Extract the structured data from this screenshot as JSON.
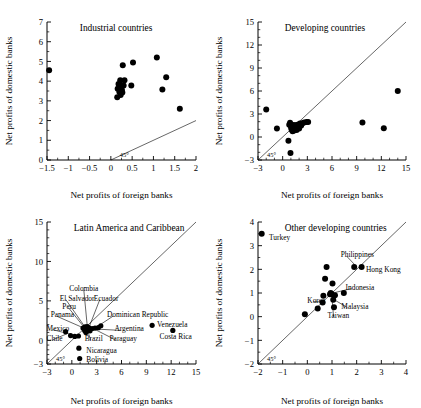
{
  "figure": {
    "name": "net-profits-domestic-vs-foreign-banks",
    "panel_count": 4
  },
  "chart_data": [
    {
      "id": "industrial-countries",
      "type": "scatter",
      "title": "Industrial countries",
      "xlabel": "Net profits of foreign banks",
      "ylabel": "Net profits of domestic banks",
      "xlim": [
        -1.5,
        2
      ],
      "ylim": [
        0,
        7
      ],
      "xticks": [
        -1.5,
        -1,
        -0.5,
        0,
        0.5,
        1,
        1.5,
        2
      ],
      "xticklabels": [
        "−1.5",
        "−1",
        "−0.5",
        "0",
        "0.5",
        "1",
        "1.5",
        "2"
      ],
      "yticks": [
        0,
        1,
        2,
        3,
        4,
        5,
        6,
        7
      ],
      "yticklabels": [
        "0",
        "1",
        "2",
        "3",
        "4",
        "5",
        "6",
        "7"
      ],
      "grid": false,
      "reference_line": {
        "label": "45°",
        "type": "identity"
      },
      "points": [
        [
          -1.45,
          4.55
        ],
        [
          0.28,
          4.8
        ],
        [
          0.52,
          4.95
        ],
        [
          0.22,
          4.05
        ],
        [
          0.32,
          4.05
        ],
        [
          0.18,
          3.85
        ],
        [
          0.24,
          3.8
        ],
        [
          0.3,
          3.78
        ],
        [
          0.48,
          3.78
        ],
        [
          0.16,
          3.62
        ],
        [
          0.21,
          3.6
        ],
        [
          0.26,
          3.55
        ],
        [
          0.2,
          3.45
        ],
        [
          0.27,
          3.42
        ],
        [
          0.23,
          3.3
        ],
        [
          0.15,
          3.18
        ],
        [
          1.08,
          5.2
        ],
        [
          1.3,
          4.2
        ],
        [
          1.21,
          3.58
        ],
        [
          1.62,
          2.6
        ]
      ]
    },
    {
      "id": "developing-countries",
      "type": "scatter",
      "title": "Developing countries",
      "xlabel": "Net profits of foreign banks",
      "ylabel": "Net profits of domestic banks",
      "xlim": [
        -3,
        15
      ],
      "ylim": [
        -3,
        15
      ],
      "xticks": [
        -3,
        0,
        3,
        6,
        9,
        12,
        15
      ],
      "xticklabels": [
        "−3",
        "0",
        "3",
        "6",
        "9",
        "12",
        "15"
      ],
      "yticks": [
        -3,
        0,
        3,
        6,
        9,
        12,
        15
      ],
      "yticklabels": [
        "−3",
        "0",
        "3",
        "6",
        "9",
        "12",
        "15"
      ],
      "grid": false,
      "reference_line": {
        "label": "45°",
        "type": "identity"
      },
      "points": [
        [
          -2.0,
          3.6
        ],
        [
          -0.7,
          1.1
        ],
        [
          0.7,
          -0.5
        ],
        [
          0.95,
          -2.1
        ],
        [
          0.8,
          1.6
        ],
        [
          0.9,
          1.85
        ],
        [
          1.0,
          1.45
        ],
        [
          1.05,
          1.15
        ],
        [
          1.1,
          0.95
        ],
        [
          1.15,
          1.35
        ],
        [
          1.2,
          0.75
        ],
        [
          1.25,
          1.25
        ],
        [
          1.3,
          1.05
        ],
        [
          1.35,
          1.55
        ],
        [
          1.4,
          0.85
        ],
        [
          1.45,
          1.3
        ],
        [
          1.5,
          1.0
        ],
        [
          1.55,
          1.5
        ],
        [
          1.6,
          1.2
        ],
        [
          1.7,
          0.9
        ],
        [
          1.8,
          1.6
        ],
        [
          1.9,
          1.35
        ],
        [
          2.0,
          1.1
        ],
        [
          2.1,
          1.75
        ],
        [
          2.25,
          1.5
        ],
        [
          2.4,
          1.8
        ],
        [
          2.6,
          1.9
        ],
        [
          2.9,
          1.95
        ],
        [
          3.1,
          1.95
        ],
        [
          9.7,
          1.9
        ],
        [
          12.3,
          1.15
        ],
        [
          14.0,
          6.0
        ]
      ]
    },
    {
      "id": "latin-america-and-caribbean",
      "type": "scatter",
      "title": "Latin America and Caribbean",
      "xlabel": "Net profits  of foreign banks",
      "ylabel": "Net profits of domestic banks",
      "xlim": [
        -3,
        15
      ],
      "ylim": [
        -3,
        15
      ],
      "xticks": [
        -3,
        0,
        3,
        6,
        9,
        12,
        15
      ],
      "xticklabels": [
        "−3",
        "0",
        "3",
        "6",
        "9",
        "12",
        "15"
      ],
      "yticks": [
        -3,
        0,
        5,
        10,
        15
      ],
      "yticklabels": [
        "−3",
        "0",
        "5",
        "10",
        "15"
      ],
      "grid": false,
      "reference_line": {
        "label": "45°",
        "type": "identity"
      },
      "points": [
        [
          -0.75,
          1.1
        ],
        [
          -0.15,
          0.6
        ],
        [
          0.35,
          0.5
        ],
        [
          0.8,
          0.55
        ],
        [
          1.35,
          1.55
        ],
        [
          1.6,
          1.7
        ],
        [
          1.55,
          1.25
        ],
        [
          1.75,
          1.45
        ],
        [
          1.7,
          1.0
        ],
        [
          1.85,
          1.75
        ],
        [
          1.95,
          1.3
        ],
        [
          2.05,
          1.6
        ],
        [
          2.2,
          1.2
        ],
        [
          2.45,
          1.5
        ],
        [
          2.8,
          1.55
        ],
        [
          3.2,
          1.6
        ],
        [
          3.5,
          1.85
        ],
        [
          0.85,
          -1.0
        ],
        [
          0.95,
          -2.3
        ],
        [
          9.7,
          1.9
        ],
        [
          12.2,
          1.25
        ]
      ],
      "annotations": [
        {
          "label": "Colombia",
          "lx": 1.45,
          "ly": 6.55,
          "px": 1.85,
          "py": 1.95,
          "anchor": "middle"
        },
        {
          "label": "El Salvador",
          "lx": -1.45,
          "ly": 5.35,
          "px": 1.55,
          "py": 1.75,
          "anchor": "start"
        },
        {
          "label": "Ecuador",
          "lx": 2.65,
          "ly": 5.35,
          "px": 2.15,
          "py": 1.85,
          "anchor": "start"
        },
        {
          "label": "Peru",
          "lx": -1.15,
          "ly": 4.35,
          "px": 1.45,
          "py": 1.7,
          "anchor": "start"
        },
        {
          "label": "Panama",
          "lx": -2.55,
          "ly": 3.25,
          "px": 1.35,
          "py": 1.6,
          "anchor": "start"
        },
        {
          "label": "Dominican Republic",
          "lx": 4.25,
          "ly": 3.25,
          "px": 3.3,
          "py": 1.9,
          "anchor": "start"
        },
        {
          "label": "Mexico",
          "lx": -3.05,
          "ly": 1.55,
          "px": -0.1,
          "py": 0.75,
          "anchor": "start"
        },
        {
          "label": "Argentina",
          "lx": 5.15,
          "ly": 1.45,
          "px": 2.6,
          "py": 1.45,
          "anchor": "start"
        },
        {
          "label": "Venezuela",
          "lx": 10.3,
          "ly": 2.0,
          "px": null,
          "py": null,
          "anchor": "start"
        },
        {
          "label": "Chile",
          "lx": -3.05,
          "ly": 0.25,
          "px": -0.55,
          "py": 0.85,
          "anchor": "start"
        },
        {
          "label": "Brazil",
          "lx": 1.55,
          "ly": 0.25,
          "px": 1.95,
          "py": 1.1,
          "anchor": "start"
        },
        {
          "label": "Paraguay",
          "lx": 4.55,
          "ly": 0.25,
          "px": 2.85,
          "py": 1.35,
          "anchor": "start"
        },
        {
          "label": "Costa Rica",
          "lx": 10.6,
          "ly": 0.55,
          "px": null,
          "py": null,
          "anchor": "start"
        },
        {
          "label": "Nicaragua",
          "lx": 1.75,
          "ly": -1.25,
          "px": null,
          "py": null,
          "anchor": "start"
        },
        {
          "label": "Bolivia",
          "lx": 1.75,
          "ly": -2.45,
          "px": null,
          "py": null,
          "anchor": "start"
        }
      ]
    },
    {
      "id": "other-developing-countries",
      "type": "scatter",
      "title": "Other developing countries",
      "xlabel": "Net profits of foreign banks",
      "ylabel": "Net profits of domestic banks",
      "xlim": [
        -2,
        4
      ],
      "ylim": [
        -2,
        4
      ],
      "xticks": [
        -2,
        -1,
        0,
        1,
        2,
        3,
        4
      ],
      "xticklabels": [
        "−2",
        "−1",
        "0",
        "1",
        "2",
        "3",
        "4"
      ],
      "yticks": [
        -2,
        -1,
        0,
        1,
        2,
        3,
        4
      ],
      "yticklabels": [
        "−2",
        "−1",
        "0",
        "1",
        "2",
        "3",
        "4"
      ],
      "grid": false,
      "reference_line": {
        "label": "45°",
        "type": "identity"
      },
      "points": [
        [
          -1.85,
          3.5
        ],
        [
          -0.1,
          0.1
        ],
        [
          0.42,
          0.35
        ],
        [
          0.62,
          0.6
        ],
        [
          0.65,
          0.88
        ],
        [
          0.72,
          1.6
        ],
        [
          0.78,
          2.1
        ],
        [
          0.92,
          0.95
        ],
        [
          0.95,
          1.0
        ],
        [
          1.0,
          0.95
        ],
        [
          1.02,
          1.4
        ],
        [
          1.05,
          0.72
        ],
        [
          1.08,
          0.4
        ],
        [
          1.12,
          0.9
        ],
        [
          1.48,
          1.0
        ],
        [
          1.9,
          2.1
        ],
        [
          2.2,
          2.1
        ]
      ],
      "annotations": [
        {
          "label": "Turkey",
          "lx": -1.55,
          "ly": 3.35,
          "px": null,
          "py": null,
          "anchor": "start"
        },
        {
          "label": "Philippines",
          "lx": 1.35,
          "ly": 2.62,
          "px": 1.9,
          "py": 2.22,
          "anchor": "start"
        },
        {
          "label": "Hong Kong",
          "lx": 2.38,
          "ly": 1.98,
          "px": null,
          "py": null,
          "anchor": "start"
        },
        {
          "label": "Indonesia",
          "lx": 1.55,
          "ly": 1.25,
          "px": 1.12,
          "py": 1.02,
          "anchor": "start"
        },
        {
          "label": "Korea",
          "lx": 0.0,
          "ly": 0.7,
          "px": 0.62,
          "py": 0.62,
          "anchor": "start"
        },
        {
          "label": "Malaysia",
          "lx": 1.38,
          "ly": 0.45,
          "px": 1.08,
          "py": 0.72,
          "anchor": "start"
        },
        {
          "label": "Taiwan",
          "lx": 0.82,
          "ly": 0.05,
          "px": 1.0,
          "py": 0.8,
          "anchor": "start"
        }
      ]
    }
  ]
}
